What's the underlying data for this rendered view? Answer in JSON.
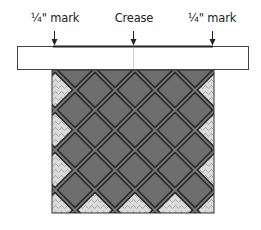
{
  "labels": {
    "left_mark": "¼\" mark",
    "crease": "Crease",
    "right_mark": "¼\" mark"
  },
  "colors": {
    "block_fill": "#6e6e6e",
    "sashing_dark": "#2a2a2a",
    "sashing_mid": "#7c7c7c",
    "setting_triangle": "#d8d8d8",
    "ruler_fill": "#ffffff",
    "ruler_stroke": "#444444"
  }
}
